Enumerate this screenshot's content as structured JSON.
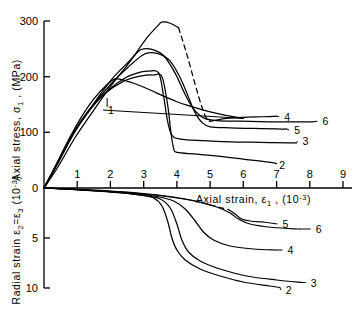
{
  "chart_data": {
    "type": "line",
    "title": "",
    "panels": [
      {
        "name": "upper",
        "ylabel": "Axial stress, σ₁ , (MPa)",
        "ylabel_parts": {
          "pre": "Axial  stress,  σ",
          "sub": "1",
          "post": " , (MPa)"
        },
        "yticks": [
          0,
          100,
          200,
          300
        ],
        "ylim": [
          0,
          300
        ],
        "xlim": [
          0,
          9
        ],
        "grid": false
      },
      {
        "name": "lower",
        "ylabel": "Radial strain ε₂=ε₃ (10⁻³)",
        "ylabel_parts": {
          "pre": "Radial strain ε",
          "sub1": "2",
          "mid": "=ε",
          "sub2": "3",
          "post": " (10",
          "sup": "-3",
          "tail": ")"
        },
        "yticks": [
          0,
          5,
          10
        ],
        "ylim": [
          0,
          10
        ],
        "xlim": [
          0,
          9
        ],
        "grid": false
      }
    ],
    "xlabel": "Axial strain, ε₁ , (10⁻³)",
    "xlabel_parts": {
      "pre": "Axial  strain,  ε",
      "sub": "1",
      "mid": " , (10",
      "sup": "-3",
      "post": ")"
    },
    "xticks": [
      0,
      1,
      2,
      3,
      4,
      5,
      6,
      7,
      8,
      9
    ],
    "xtick_labels": [
      "0",
      "1",
      "2",
      "3",
      "4",
      "5",
      "6",
      "7",
      "8",
      "9"
    ],
    "upper_ytick_labels": [
      "0",
      "100",
      "200",
      "300"
    ],
    "lower_ytick_labels": [
      "0",
      "5",
      "10"
    ],
    "legend_position": "inline-curve-end-labels",
    "series": [
      {
        "name": "1",
        "label": "1",
        "label_xy": [
          1.9,
          140
        ],
        "panel": "upper",
        "peak_stress": 196,
        "peak_strain": 2.15,
        "points": [
          [
            0,
            0
          ],
          [
            0.3,
            34
          ],
          [
            0.7,
            82
          ],
          [
            1.1,
            125
          ],
          [
            1.5,
            160
          ],
          [
            1.9,
            186
          ],
          [
            2.15,
            196
          ],
          [
            2.45,
            193
          ],
          [
            2.8,
            186
          ],
          [
            3.2,
            176
          ],
          [
            3.6,
            165
          ],
          [
            4.0,
            155
          ],
          [
            4.4,
            147
          ],
          [
            4.8,
            140
          ],
          [
            5.2,
            134
          ],
          [
            5.6,
            129
          ],
          [
            6.0,
            125
          ]
        ]
      },
      {
        "name": "2",
        "label": "2",
        "label_xy": [
          7.05,
          42
        ],
        "panel": "upper",
        "peak_stress": 203,
        "peak_strain": 3.3,
        "points": [
          [
            0,
            0
          ],
          [
            0.35,
            38
          ],
          [
            0.8,
            90
          ],
          [
            1.3,
            134
          ],
          [
            1.8,
            168
          ],
          [
            2.4,
            192
          ],
          [
            2.9,
            201
          ],
          [
            3.3,
            203
          ],
          [
            3.55,
            200
          ],
          [
            3.72,
            150
          ],
          [
            3.82,
            100
          ],
          [
            3.9,
            72
          ],
          [
            4.0,
            64
          ],
          [
            4.6,
            61
          ],
          [
            5.3,
            57
          ],
          [
            6.0,
            52
          ],
          [
            6.7,
            47
          ],
          [
            7.0,
            44
          ]
        ]
      },
      {
        "name": "3",
        "label": "3",
        "label_xy": [
          7.75,
          84
        ],
        "panel": "upper",
        "peak_stress": 210,
        "peak_strain": 3.15,
        "points": [
          [
            0,
            0
          ],
          [
            0.35,
            40
          ],
          [
            0.85,
            96
          ],
          [
            1.35,
            140
          ],
          [
            1.9,
            174
          ],
          [
            2.45,
            198
          ],
          [
            2.9,
            208
          ],
          [
            3.15,
            210
          ],
          [
            3.45,
            207
          ],
          [
            3.6,
            165
          ],
          [
            3.72,
            120
          ],
          [
            3.85,
            95
          ],
          [
            4.1,
            88
          ],
          [
            4.8,
            85
          ],
          [
            5.6,
            83
          ],
          [
            6.5,
            82
          ],
          [
            7.4,
            81
          ],
          [
            7.6,
            81
          ]
        ]
      },
      {
        "name": "4",
        "label": "4",
        "label_xy": [
          7.2,
          128
        ],
        "panel": "upper",
        "peak_stress": 298,
        "peak_strain": 3.55,
        "points": [
          [
            0,
            0
          ],
          [
            0.4,
            36
          ],
          [
            0.95,
            92
          ],
          [
            1.5,
            140
          ],
          [
            2.05,
            186
          ],
          [
            2.6,
            228
          ],
          [
            3.1,
            270
          ],
          [
            3.45,
            293
          ],
          [
            3.55,
            298
          ],
          [
            3.8,
            296
          ],
          [
            4.05,
            288
          ]
        ],
        "dashed_points": [
          [
            4.05,
            288
          ],
          [
            4.3,
            240
          ],
          [
            4.55,
            186
          ],
          [
            4.75,
            146
          ],
          [
            4.9,
            124
          ],
          [
            5.0,
            120
          ]
        ],
        "post_points": [
          [
            5.0,
            120
          ],
          [
            5.5,
            125
          ],
          [
            6.0,
            127
          ],
          [
            6.6,
            128
          ],
          [
            7.0,
            129
          ]
        ]
      },
      {
        "name": "5",
        "label": "5",
        "label_xy": [
          7.5,
          104
        ],
        "panel": "upper",
        "peak_stress": 243,
        "peak_strain": 3.2,
        "points": [
          [
            0,
            0
          ],
          [
            0.38,
            40
          ],
          [
            0.9,
            98
          ],
          [
            1.45,
            146
          ],
          [
            2.0,
            186
          ],
          [
            2.55,
            218
          ],
          [
            2.95,
            238
          ],
          [
            3.2,
            243
          ],
          [
            3.5,
            240
          ],
          [
            3.8,
            228
          ],
          [
            4.1,
            198
          ],
          [
            4.35,
            163
          ],
          [
            4.55,
            135
          ],
          [
            4.75,
            118
          ],
          [
            5.0,
            110
          ],
          [
            5.6,
            108
          ],
          [
            6.3,
            107
          ],
          [
            7.0,
            106
          ],
          [
            7.3,
            106
          ]
        ]
      },
      {
        "name": "6",
        "label": "6",
        "label_xy": [
          8.35,
          120
        ],
        "panel": "upper",
        "peak_stress": 250,
        "peak_strain": 3.0,
        "points": [
          [
            0,
            0
          ],
          [
            0.4,
            44
          ],
          [
            0.95,
            104
          ],
          [
            1.5,
            152
          ],
          [
            2.05,
            196
          ],
          [
            2.6,
            230
          ],
          [
            2.85,
            246
          ],
          [
            3.0,
            250
          ],
          [
            3.3,
            248
          ],
          [
            3.6,
            238
          ],
          [
            3.95,
            206
          ],
          [
            4.25,
            168
          ],
          [
            4.5,
            142
          ],
          [
            4.8,
            126
          ],
          [
            5.2,
            121
          ],
          [
            5.9,
            120
          ],
          [
            6.8,
            119
          ],
          [
            7.7,
            119
          ],
          [
            8.1,
            119
          ]
        ]
      },
      {
        "name": "2",
        "label": "2",
        "panel": "lower",
        "label_xy": [
          7.25,
          10.2
        ],
        "points": [
          [
            0,
            0
          ],
          [
            0.6,
            0.1
          ],
          [
            1.4,
            0.25
          ],
          [
            2.2,
            0.45
          ],
          [
            2.9,
            0.72
          ],
          [
            3.3,
            1.0
          ],
          [
            3.55,
            1.8
          ],
          [
            3.72,
            3.3
          ],
          [
            3.85,
            5.0
          ],
          [
            4.0,
            6.2
          ],
          [
            4.25,
            7.2
          ],
          [
            4.7,
            8.1
          ],
          [
            5.3,
            8.8
          ],
          [
            6.0,
            9.4
          ],
          [
            6.8,
            9.8
          ],
          [
            7.1,
            9.95
          ]
        ]
      },
      {
        "name": "3",
        "label": "3",
        "panel": "lower",
        "label_xy": [
          8.0,
          9.45
        ],
        "points": [
          [
            0,
            0
          ],
          [
            0.6,
            0.1
          ],
          [
            1.5,
            0.28
          ],
          [
            2.4,
            0.5
          ],
          [
            3.0,
            0.75
          ],
          [
            3.5,
            1.1
          ],
          [
            3.8,
            2.0
          ],
          [
            4.0,
            3.6
          ],
          [
            4.15,
            5.2
          ],
          [
            4.35,
            6.4
          ],
          [
            4.7,
            7.3
          ],
          [
            5.3,
            8.1
          ],
          [
            6.1,
            8.8
          ],
          [
            7.0,
            9.2
          ],
          [
            7.8,
            9.45
          ]
        ]
      },
      {
        "name": "4",
        "label": "4",
        "panel": "lower",
        "label_xy": [
          7.3,
          6.2
        ],
        "points": [
          [
            0,
            0
          ],
          [
            0.7,
            0.1
          ],
          [
            1.7,
            0.3
          ],
          [
            2.7,
            0.55
          ],
          [
            3.4,
            0.85
          ],
          [
            3.9,
            1.3
          ],
          [
            4.25,
            2.1
          ],
          [
            4.55,
            3.3
          ],
          [
            4.8,
            4.4
          ],
          [
            5.1,
            5.2
          ],
          [
            5.6,
            5.8
          ],
          [
            6.3,
            6.1
          ],
          [
            7.0,
            6.2
          ]
        ]
      },
      {
        "name": "5",
        "label": "5",
        "panel": "lower",
        "label_xy": [
          7.15,
          3.6
        ],
        "points": [
          [
            0,
            0
          ],
          [
            0.8,
            0.1
          ],
          [
            1.9,
            0.28
          ],
          [
            3.0,
            0.55
          ],
          [
            3.9,
            0.9
          ],
          [
            4.5,
            1.25
          ],
          [
            5.0,
            1.7
          ]
        ],
        "dashed_points": [
          [
            5.0,
            1.7
          ],
          [
            5.3,
            1.95
          ],
          [
            5.55,
            2.15
          ]
        ],
        "post_points": [
          [
            5.55,
            2.15
          ],
          [
            5.75,
            2.6
          ],
          [
            5.95,
            3.1
          ],
          [
            6.2,
            3.3
          ],
          [
            6.6,
            3.4
          ]
        ]
      },
      {
        "name": "6",
        "label": "6",
        "panel": "lower",
        "label_xy": [
          8.15,
          4.1
        ],
        "points": [
          [
            0,
            0
          ],
          [
            0.8,
            0.12
          ],
          [
            1.9,
            0.32
          ],
          [
            3.0,
            0.6
          ],
          [
            3.9,
            0.95
          ],
          [
            4.6,
            1.35
          ],
          [
            5.2,
            1.9
          ],
          [
            5.6,
            2.5
          ],
          [
            5.85,
            3.1
          ],
          [
            6.2,
            3.6
          ],
          [
            6.9,
            3.95
          ],
          [
            7.7,
            4.1
          ]
        ]
      }
    ],
    "annotations": [
      {
        "text": "1",
        "panel": "upper",
        "kind": "leader-label"
      },
      {
        "text": "dashed segment indicates extrapolated / unstable region",
        "kind": "note",
        "visible": false
      }
    ]
  },
  "colors": {
    "line": "#000000",
    "background": "#ffffff",
    "axis": "#000000"
  }
}
